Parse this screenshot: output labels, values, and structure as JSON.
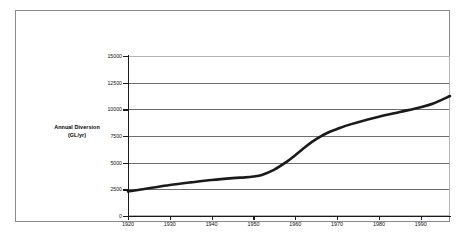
{
  "figure": {
    "axis_caption_line1": "Annual Diversion",
    "axis_caption_line2": "(GL/yr)",
    "frame_color": "#8a8a8a",
    "grid_color": "#6e6e6e",
    "series_color": "#1a1a1a"
  },
  "chart_data": {
    "type": "line",
    "title": "",
    "subtitle": "",
    "xlabel": "",
    "ylabel": "Annual Diversion (GL/yr)",
    "xlim": [
      1920,
      1997
    ],
    "ylim": [
      0,
      15000
    ],
    "grid": true,
    "legend": null,
    "xticks": [
      1920,
      1930,
      1940,
      1950,
      1960,
      1970,
      1980,
      1990
    ],
    "xtick_labels": [
      "1920",
      "1930",
      "1940",
      "1950",
      "1960",
      "1970",
      "1980",
      "1990"
    ],
    "yticks": [
      0,
      2500,
      5000,
      7500,
      10000,
      12500,
      15000
    ],
    "ytick_labels": [
      "0",
      "2500",
      "5000",
      "7500",
      "10000",
      "12500",
      "15000"
    ],
    "series": [
      {
        "name": "Annual Diversion",
        "x": [
          1920,
          1925,
          1930,
          1935,
          1940,
          1945,
          1948,
          1950,
          1952,
          1955,
          1958,
          1960,
          1962,
          1964,
          1966,
          1968,
          1970,
          1972,
          1975,
          1980,
          1985,
          1990,
          1993,
          1997
        ],
        "values": [
          2300,
          2600,
          2900,
          3150,
          3380,
          3550,
          3620,
          3700,
          3850,
          4350,
          5100,
          5700,
          6350,
          6950,
          7450,
          7850,
          8150,
          8450,
          8800,
          9300,
          9750,
          10200,
          10550,
          11250
        ]
      }
    ]
  }
}
